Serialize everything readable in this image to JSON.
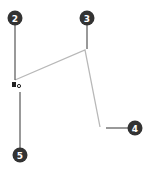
{
  "diagram": {
    "colors": {
      "callout_fill": "#333333",
      "callout_text": "#ffffff",
      "leader_line": "#555555",
      "shape_line": "#b0b0b0",
      "marker": "#222222"
    },
    "callouts": [
      {
        "label": "2",
        "cx": 15,
        "cy": 18,
        "target": [
          15,
          80
        ]
      },
      {
        "label": "3",
        "cx": 87,
        "cy": 18,
        "target": [
          87,
          49
        ]
      },
      {
        "label": "4",
        "cx": 135,
        "cy": 128,
        "target": [
          106,
          128
        ]
      },
      {
        "label": "5",
        "cx": 20,
        "cy": 155,
        "target": [
          20,
          92
        ]
      }
    ],
    "shape_polyline": [
      [
        15,
        80
      ],
      [
        85,
        50
      ],
      [
        100,
        127
      ]
    ],
    "marker": {
      "icon": "anchor-point-marker",
      "x": 14,
      "y": 84
    }
  }
}
